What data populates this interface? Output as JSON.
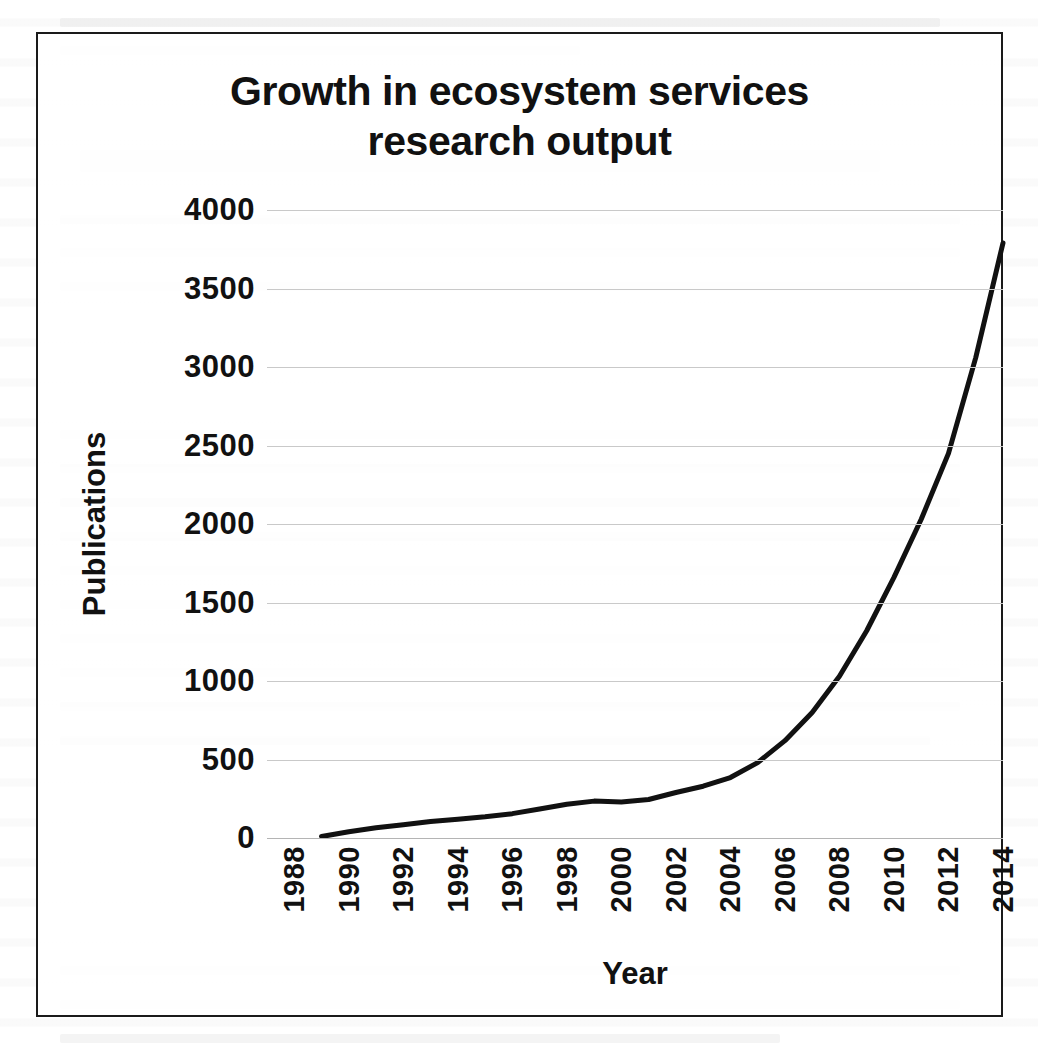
{
  "figure": {
    "title": "Growth in ecosystem services research output",
    "title_line1": "Growth in ecosystem services",
    "title_line2": "research output",
    "frame_color": "#1a1a1a",
    "background_color": "#ffffff",
    "line_color": "#111111"
  },
  "chart_data": {
    "type": "line",
    "title": "Growth in ecosystem services research output",
    "xlabel": "Year",
    "ylabel": "Publications",
    "xlim": [
      1988,
      2015
    ],
    "ylim": [
      0,
      4000
    ],
    "grid": true,
    "legend": "none",
    "x_tick_labels": [
      "1988",
      "1990",
      "1992",
      "1994",
      "1996",
      "1998",
      "2000",
      "2002",
      "2004",
      "2006",
      "2008",
      "2010",
      "2012",
      "2014"
    ],
    "x_tick_values": [
      1988,
      1990,
      1992,
      1994,
      1996,
      1998,
      2000,
      2002,
      2004,
      2006,
      2008,
      2010,
      2012,
      2014
    ],
    "y_tick_labels": [
      "0",
      "500",
      "1000",
      "1500",
      "2000",
      "2500",
      "3000",
      "3500",
      "4000"
    ],
    "y_tick_values": [
      0,
      500,
      1000,
      1500,
      2000,
      2500,
      3000,
      3500,
      4000
    ],
    "series": [
      {
        "name": "Publications",
        "color": "#111111",
        "line_width": 5,
        "x": [
          1990,
          1991,
          1992,
          1993,
          1994,
          1995,
          1996,
          1997,
          1998,
          1999,
          2000,
          2001,
          2002,
          2003,
          2004,
          2005,
          2006,
          2007,
          2008,
          2009,
          2010,
          2011,
          2012,
          2013,
          2014,
          2015
        ],
        "values": [
          10,
          40,
          65,
          85,
          105,
          120,
          135,
          155,
          185,
          215,
          235,
          230,
          245,
          290,
          330,
          385,
          480,
          620,
          800,
          1030,
          1320,
          1660,
          2030,
          2450,
          3060,
          3790
        ]
      }
    ]
  }
}
